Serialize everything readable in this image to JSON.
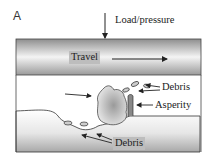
{
  "figure": {
    "panel_label": "A",
    "labels": {
      "load": "Load/pressure",
      "travel": "Travel",
      "debris_top": "Debris",
      "asperity": "Asperity",
      "debris_bottom": "Debris"
    },
    "colors": {
      "surface_dark": "#8c8c8c",
      "surface_light": "#f2f2f2",
      "label_box": "#bdbdbd",
      "stroke": "#222222"
    }
  }
}
